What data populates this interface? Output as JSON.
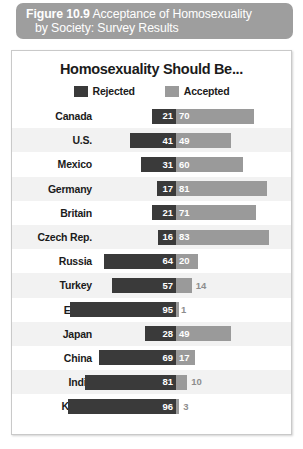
{
  "figure": {
    "number": "Figure 10.9",
    "caption": "Acceptance of Homosexuality",
    "caption_line2": "by Society: Survey Results"
  },
  "chart_data": {
    "type": "bar",
    "title": "Homosexuality Should Be...",
    "xlabel": "",
    "ylabel": "",
    "orientation": "horizontal",
    "layout": "diverging",
    "grid": false,
    "legend_position": "top-center",
    "xlim": [
      0,
      100
    ],
    "categories": [
      "Canada",
      "U.S.",
      "Mexico",
      "Germany",
      "Britain",
      "Czech Rep.",
      "Russia",
      "Turkey",
      "Egypt",
      "Japan",
      "China",
      "India",
      "Kenya"
    ],
    "series": [
      {
        "name": "Rejected",
        "color": "#3a3a3a",
        "values": [
          21,
          41,
          31,
          17,
          21,
          16,
          64,
          57,
          95,
          28,
          69,
          81,
          96
        ]
      },
      {
        "name": "Accepted",
        "color": "#9a9a9a",
        "values": [
          70,
          49,
          60,
          81,
          71,
          83,
          20,
          14,
          1,
          49,
          17,
          10,
          3
        ]
      }
    ]
  },
  "source": {
    "text": ""
  }
}
